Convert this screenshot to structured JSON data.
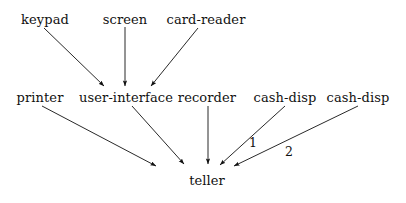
{
  "diagram": {
    "background_color": "#ffffff",
    "ink_color": "#111111",
    "nodes": [
      {
        "id": "keypad",
        "label": "keypad",
        "x": 45,
        "y": 19
      },
      {
        "id": "screen",
        "label": "screen",
        "x": 125,
        "y": 19
      },
      {
        "id": "card-reader",
        "label": "card-reader",
        "x": 206,
        "y": 19
      },
      {
        "id": "printer",
        "label": "printer",
        "x": 40,
        "y": 97
      },
      {
        "id": "user-interface",
        "label": "user-interface",
        "x": 126,
        "y": 97
      },
      {
        "id": "recorder",
        "label": "recorder",
        "x": 207,
        "y": 97
      },
      {
        "id": "cash-disp-1",
        "label": "cash-disp",
        "x": 285,
        "y": 97
      },
      {
        "id": "cash-disp-2",
        "label": "cash-disp",
        "x": 358,
        "y": 97
      },
      {
        "id": "teller",
        "label": "teller",
        "x": 207,
        "y": 180
      }
    ],
    "edges": [
      {
        "id": "keypad-to-user-interface",
        "from": "keypad",
        "to": "user-interface",
        "x1": 44,
        "y1": 28,
        "x2": 104,
        "y2": 86
      },
      {
        "id": "screen-to-user-interface",
        "from": "screen",
        "to": "user-interface",
        "x1": 125,
        "y1": 27,
        "x2": 125,
        "y2": 86
      },
      {
        "id": "card-reader-to-user-interface",
        "from": "card-reader",
        "to": "user-interface",
        "x1": 198,
        "y1": 28,
        "x2": 151,
        "y2": 86
      },
      {
        "id": "printer-to-teller",
        "from": "printer",
        "to": "teller",
        "x1": 42,
        "y1": 106,
        "x2": 156,
        "y2": 166
      },
      {
        "id": "user-interface-to-teller",
        "from": "user-interface",
        "to": "teller",
        "x1": 132,
        "y1": 106,
        "x2": 184,
        "y2": 164
      },
      {
        "id": "recorder-to-teller",
        "from": "recorder",
        "to": "teller",
        "x1": 208,
        "y1": 106,
        "x2": 208,
        "y2": 164
      },
      {
        "id": "cash-disp-1-to-teller",
        "from": "cash-disp-1",
        "to": "teller",
        "x1": 285,
        "y1": 106,
        "x2": 220,
        "y2": 165
      },
      {
        "id": "cash-disp-2-to-teller",
        "from": "cash-disp-2",
        "to": "teller",
        "x1": 358,
        "y1": 106,
        "x2": 234,
        "y2": 166
      }
    ],
    "edge_labels": [
      {
        "id": "edge-label-1",
        "label": "1",
        "x": 253,
        "y": 143,
        "edge": "cash-disp-1-to-teller"
      },
      {
        "id": "edge-label-2",
        "label": "2",
        "x": 289,
        "y": 152,
        "edge": "cash-disp-2-to-teller"
      }
    ]
  }
}
